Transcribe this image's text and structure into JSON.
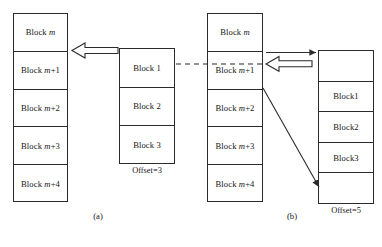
{
  "figure": {
    "background": "#ffffff",
    "stroke": "#2b2b2b",
    "text_color": "#151515"
  },
  "panel_a": {
    "caption": "(a)",
    "memory_column": {
      "name": "memory-blocks-column-a",
      "cells": [
        {
          "prefix": "Block ",
          "var": "m",
          "suffix": ""
        },
        {
          "prefix": "Block ",
          "var": "m",
          "suffix": "+1"
        },
        {
          "prefix": "Block ",
          "var": "m",
          "suffix": "+2"
        },
        {
          "prefix": "Block ",
          "var": "m",
          "suffix": "+3"
        },
        {
          "prefix": "Block ",
          "var": "m",
          "suffix": "+4"
        }
      ]
    },
    "buffer_column": {
      "name": "buffer-column-a",
      "cells": [
        {
          "label": "Block 1"
        },
        {
          "label": "Block 2"
        },
        {
          "label": "Block 3"
        }
      ],
      "offset_label": "Offset=3"
    },
    "block_arrow": {
      "name": "hollow-arrow-left-a",
      "direction": "left"
    }
  },
  "panel_b": {
    "caption": "(b)",
    "memory_column": {
      "name": "memory-blocks-column-b",
      "cells": [
        {
          "prefix": "Block ",
          "var": "m",
          "suffix": ""
        },
        {
          "prefix": "Block ",
          "var": "m",
          "suffix": "+1"
        },
        {
          "prefix": "Block ",
          "var": "m",
          "suffix": "+2"
        },
        {
          "prefix": "Block ",
          "var": "m",
          "suffix": "+3"
        },
        {
          "prefix": "Block ",
          "var": "m",
          "suffix": "+4"
        }
      ]
    },
    "buffer_column": {
      "name": "buffer-column-b",
      "cells": [
        {
          "label": ""
        },
        {
          "label": "Block1"
        },
        {
          "label": "Block2"
        },
        {
          "label": "Block3"
        },
        {
          "label": ""
        }
      ],
      "offset_label": "Offset=5"
    },
    "block_arrow": {
      "name": "hollow-arrow-left-b",
      "direction": "left"
    },
    "thin_arrow": {
      "name": "thin-arrow-right-b",
      "direction": "right"
    },
    "diagonal_arrow": {
      "name": "diagonal-arrow-b",
      "direction": "down-right"
    },
    "dashed_guide": {
      "name": "dashed-alignment-line"
    }
  }
}
